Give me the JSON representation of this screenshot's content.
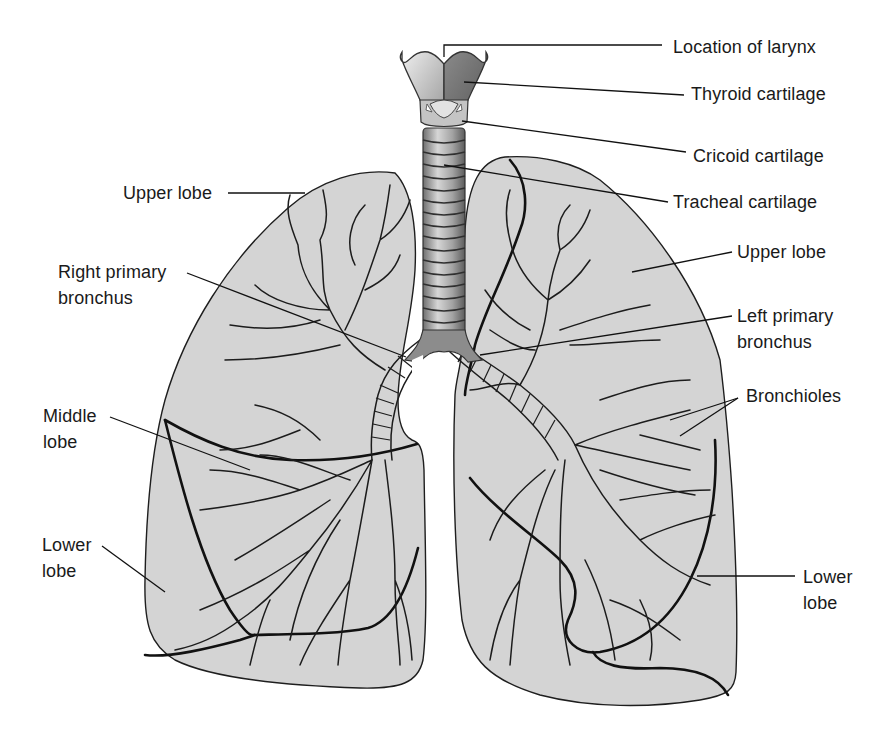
{
  "figure": {
    "colors": {
      "background": "#ffffff",
      "lung_fill": "#d4d4d4",
      "outline": "#1e1e1e",
      "trachea_ring": "#9a9a9a",
      "label_text": "#1a1a1a"
    }
  },
  "labels": {
    "location_of_larynx": "Location of larynx",
    "thyroid_cartilage": "Thyroid cartilage",
    "cricoid_cartilage": "Cricoid cartilage",
    "tracheal_cartilage": "Tracheal cartilage",
    "right_upper_lobe": "Upper lobe",
    "right_primary_bronchus": "Right primary\nbronchus",
    "left_upper_lobe": "Upper lobe",
    "left_primary_bronchus": "Left primary\nbronchus",
    "bronchioles": "Bronchioles",
    "middle_lobe": "Middle\nlobe",
    "right_lower_lobe": "Lower\nlobe",
    "left_lower_lobe": "Lower\nlobe"
  }
}
